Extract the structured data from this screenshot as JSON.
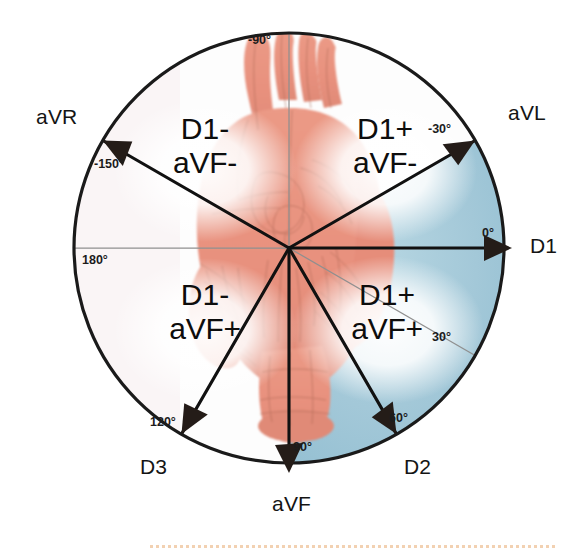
{
  "figure": {
    "center": {
      "x": 289,
      "y": 248
    },
    "radius": 216,
    "colors": {
      "normal_axis_sector": "#9ec6d6",
      "heart": "#e8917e",
      "circle_outline": "#1a1a1a",
      "minor_axis_line": "#8d8d8d",
      "major_axis_line": "#111111",
      "label_text": "#141414",
      "bottom_rule": "#f0c9a4"
    },
    "normal_axis_sector": {
      "start_deg": -30,
      "end_deg": 90
    }
  },
  "leads": [
    {
      "name": "aVR",
      "angle_deg": -150,
      "angle_label": "-150°",
      "has_arrow": true
    },
    {
      "name": "aVL",
      "angle_deg": -30,
      "angle_label": "-30°",
      "has_arrow": true
    },
    {
      "name": "D1",
      "angle_deg": 0,
      "angle_label": "0°",
      "has_arrow": true
    },
    {
      "name": "D2",
      "angle_deg": 60,
      "angle_label": "60°",
      "has_arrow": true
    },
    {
      "name": "aVF",
      "angle_deg": 90,
      "angle_label": "90°",
      "has_arrow": true
    },
    {
      "name": "D3",
      "angle_deg": 120,
      "angle_label": "120°",
      "has_arrow": true
    }
  ],
  "minor_axes": [
    {
      "angle_deg": -90,
      "angle_label": "-90°"
    },
    {
      "angle_deg": 30,
      "angle_label": "30°"
    },
    {
      "angle_deg": 180,
      "angle_label": "180°"
    }
  ],
  "lead_labels": {
    "avr": "aVR",
    "avl": "aVL",
    "d1": "D1",
    "d2": "D2",
    "avf": "aVF",
    "d3": "D3"
  },
  "degree_labels": {
    "neg150": "-150°",
    "neg90": "-90°",
    "neg30": "-30°",
    "zero": "0°",
    "thirty": "30°",
    "sixty": "60°",
    "ninety": "90°",
    "onetwenty": "120°",
    "oneeighty": "180°"
  },
  "quadrants": [
    {
      "id": "upper-left",
      "d1": "D1-",
      "avf": "aVF-",
      "angle_range": "-90° to 180°"
    },
    {
      "id": "upper-right",
      "d1": "D1+",
      "avf": "aVF-",
      "angle_range": "-90° to 0°"
    },
    {
      "id": "lower-left",
      "d1": "D1-",
      "avf": "aVF+",
      "angle_range": "90° to 180°"
    },
    {
      "id": "lower-right",
      "d1": "D1+",
      "avf": "aVF+",
      "angle_range": "0° to 90°"
    }
  ]
}
